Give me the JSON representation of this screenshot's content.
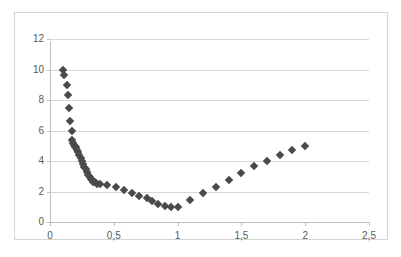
{
  "chart_data": {
    "type": "scatter",
    "title": "",
    "subtitle": "",
    "xlabel": "",
    "ylabel": "",
    "xlim": [
      0,
      2.5
    ],
    "ylim": [
      0,
      12
    ],
    "grid": "horizontal",
    "legend": "none",
    "marker_shape": "diamond",
    "marker_color": "#4a4a4a",
    "decimal_separator": ",",
    "x_ticks": [
      0,
      0.5,
      1,
      1.5,
      2,
      2.5
    ],
    "x_tick_labels": [
      "0",
      "0,5",
      "1",
      "1,5",
      "2",
      "2,5"
    ],
    "y_ticks": [
      0,
      2,
      4,
      6,
      8,
      10,
      12
    ],
    "y_tick_labels": [
      "0",
      "2",
      "4",
      "6",
      "8",
      "10",
      "12"
    ],
    "series": [
      {
        "name": "series1",
        "points": [
          [
            0.1,
            10.0
          ],
          [
            0.11,
            9.65
          ],
          [
            0.13,
            9.0
          ],
          [
            0.14,
            8.3
          ],
          [
            0.15,
            7.45
          ],
          [
            0.16,
            6.65
          ],
          [
            0.17,
            5.95
          ],
          [
            0.175,
            5.35
          ],
          [
            0.18,
            5.15
          ],
          [
            0.19,
            5.05
          ],
          [
            0.195,
            4.95
          ],
          [
            0.2,
            4.9
          ],
          [
            0.21,
            4.75
          ],
          [
            0.22,
            4.6
          ],
          [
            0.23,
            4.4
          ],
          [
            0.24,
            4.2
          ],
          [
            0.25,
            4.0
          ],
          [
            0.26,
            3.8
          ],
          [
            0.27,
            3.6
          ],
          [
            0.28,
            3.45
          ],
          [
            0.29,
            3.25
          ],
          [
            0.3,
            3.1
          ],
          [
            0.31,
            2.95
          ],
          [
            0.32,
            2.85
          ],
          [
            0.33,
            2.75
          ],
          [
            0.34,
            2.65
          ],
          [
            0.35,
            2.6
          ],
          [
            0.37,
            2.5
          ],
          [
            0.39,
            2.48
          ],
          [
            0.45,
            2.45
          ],
          [
            0.52,
            2.3
          ],
          [
            0.58,
            2.12
          ],
          [
            0.64,
            1.9
          ],
          [
            0.7,
            1.72
          ],
          [
            0.76,
            1.55
          ],
          [
            0.8,
            1.38
          ],
          [
            0.85,
            1.18
          ],
          [
            0.9,
            1.05
          ],
          [
            0.95,
            1.0
          ],
          [
            1.0,
            1.0
          ],
          [
            1.1,
            1.45
          ],
          [
            1.2,
            1.88
          ],
          [
            1.3,
            2.32
          ],
          [
            1.4,
            2.75
          ],
          [
            1.5,
            3.2
          ],
          [
            1.6,
            3.65
          ],
          [
            1.7,
            4.03
          ],
          [
            1.8,
            4.38
          ],
          [
            1.9,
            4.7
          ],
          [
            2.0,
            4.98
          ]
        ]
      }
    ]
  },
  "frame": {
    "border_color": "#d4d4d4",
    "background": "#ffffff",
    "gridline_color": "#d9d9d9",
    "axis_color": "#bfbfbf",
    "tick_label_color": "#5a5a5a"
  }
}
